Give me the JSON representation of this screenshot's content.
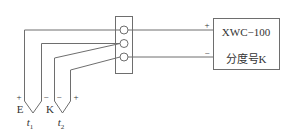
{
  "diagram": {
    "type": "thermocouple-wiring",
    "colors": {
      "line": "#6e6e6e",
      "text": "#333333",
      "background": "#ffffff"
    },
    "instrument": {
      "model": "XWC−100",
      "graduation": "分度号K",
      "plus": "+",
      "minus": "−"
    },
    "terminal_block": {
      "terminals": 3
    },
    "thermocouples": [
      {
        "name": "E",
        "plus": "+",
        "minus": "−",
        "temp_label": "t",
        "temp_sub": "1"
      },
      {
        "name": "K",
        "plus": "+",
        "minus": "−",
        "temp_label": "t",
        "temp_sub": "2"
      }
    ]
  }
}
